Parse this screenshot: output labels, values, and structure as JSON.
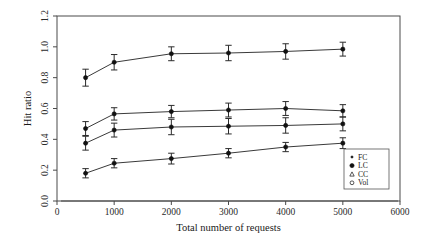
{
  "chart_data": {
    "type": "line",
    "title": "",
    "xlabel": "Total number of requests",
    "ylabel": "Hit ratio",
    "xlim": [
      0,
      6000
    ],
    "ylim": [
      0.0,
      1.2
    ],
    "xticks": [
      0,
      1000,
      2000,
      3000,
      4000,
      5000,
      6000
    ],
    "xtick_labels": [
      "0",
      "1000",
      "2000",
      "3000",
      "4000",
      "5000",
      "6000"
    ],
    "yticks": [
      0.0,
      0.2,
      0.4,
      0.6,
      0.8,
      1.0,
      1.2
    ],
    "ytick_labels": [
      "0.0",
      "0.2",
      "0.4",
      "0.6",
      "0.8",
      "1.0",
      "1.2"
    ],
    "grid": false,
    "error_bars": true,
    "legend_position": "bottom-right",
    "x": [
      500,
      1000,
      2000,
      3000,
      4000,
      5000
    ],
    "series": [
      {
        "name": "FC",
        "marker": "filled-dot",
        "values": [
          0.8,
          0.9,
          0.955,
          0.96,
          0.97,
          0.985
        ],
        "errors": [
          0.055,
          0.05,
          0.045,
          0.05,
          0.05,
          0.045
        ]
      },
      {
        "name": "LC",
        "marker": "filled-circle",
        "values": [
          0.47,
          0.565,
          0.58,
          0.59,
          0.6,
          0.585
        ],
        "errors": [
          0.045,
          0.04,
          0.04,
          0.045,
          0.045,
          0.04
        ]
      },
      {
        "name": "CC",
        "marker": "triangle",
        "values": [
          0.375,
          0.46,
          0.48,
          0.485,
          0.49,
          0.5
        ],
        "errors": [
          0.045,
          0.045,
          0.05,
          0.05,
          0.05,
          0.045
        ]
      },
      {
        "name": "Vol",
        "marker": "open-circle",
        "values": [
          0.18,
          0.245,
          0.275,
          0.31,
          0.35,
          0.375
        ],
        "errors": [
          0.03,
          0.03,
          0.035,
          0.03,
          0.03,
          0.035
        ]
      }
    ]
  },
  "legend": {
    "entries": [
      {
        "label": "FC",
        "marker": "filled-dot"
      },
      {
        "label": "LC",
        "marker": "filled-circle"
      },
      {
        "label": "CC",
        "marker": "triangle"
      },
      {
        "label": "Vol",
        "marker": "open-circle"
      }
    ]
  },
  "colors": {
    "line": "#3a3a3a",
    "marker": "#111111",
    "axis": "#4a4a4a",
    "background": "#ffffff"
  }
}
